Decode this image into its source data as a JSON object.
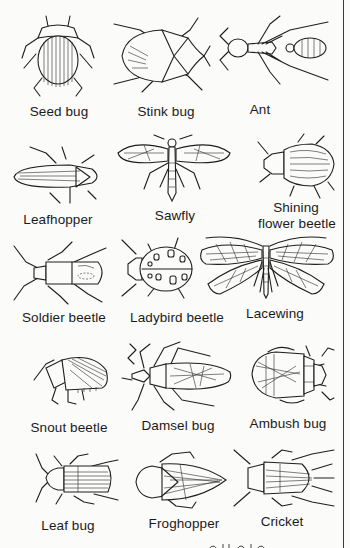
{
  "figure": {
    "rows": [
      {
        "items": [
          {
            "name": "Seed bug",
            "icon": "seed-bug-drawing"
          },
          {
            "name": "Stink bug",
            "icon": "stink-bug-drawing"
          },
          {
            "name": "Ant",
            "icon": "ant-drawing"
          }
        ]
      },
      {
        "items": [
          {
            "name": "Leafhopper",
            "icon": "leafhopper-drawing"
          },
          {
            "name": "Sawfly",
            "icon": "sawfly-drawing"
          },
          {
            "name": "Shining",
            "name_line2": "flower beetle",
            "icon": "shining-flower-beetle-drawing"
          }
        ]
      },
      {
        "items": [
          {
            "name": "Soldier beetle",
            "icon": "soldier-beetle-drawing"
          },
          {
            "name": "Ladybird beetle",
            "icon": "ladybird-beetle-drawing"
          },
          {
            "name": "Lacewing",
            "icon": "lacewing-drawing"
          }
        ]
      },
      {
        "items": [
          {
            "name": "Snout beetle",
            "icon": "snout-beetle-drawing"
          },
          {
            "name": "Damsel bug",
            "icon": "damsel-bug-drawing"
          },
          {
            "name": "Ambush bug",
            "icon": "ambush-bug-drawing"
          }
        ]
      },
      {
        "items": [
          {
            "name": "Leaf bug",
            "icon": "leaf-bug-drawing"
          },
          {
            "name": "Froghopper",
            "icon": "froghopper-drawing"
          },
          {
            "name": "Cricket",
            "icon": "cricket-drawing"
          }
        ]
      }
    ]
  },
  "colors": {
    "ink": "#1e1e1e",
    "paper": "#fbfbfa"
  }
}
